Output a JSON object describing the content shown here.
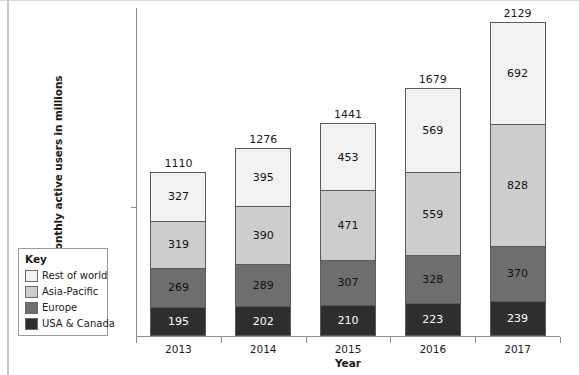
{
  "chart_data": {
    "type": "bar",
    "subtype": "stacked-bar",
    "title": "",
    "xlabel": "Year",
    "ylabel": "Monthly active users in millions",
    "categories": [
      "2013",
      "2014",
      "2015",
      "2016",
      "2017"
    ],
    "series": [
      {
        "name": "USA & Canada",
        "color": "#2e2e2e",
        "label_color": "#ffffff",
        "values": [
          195,
          202,
          210,
          223,
          239
        ]
      },
      {
        "name": "Europe",
        "color": "#6e6e6e",
        "label_color": "#111111",
        "values": [
          269,
          289,
          307,
          328,
          370
        ]
      },
      {
        "name": "Asia-Pacific",
        "color": "#cdcdcd",
        "label_color": "#111111",
        "values": [
          319,
          390,
          471,
          559,
          828
        ]
      },
      {
        "name": "Rest of world",
        "color": "#f2f2f2",
        "label_color": "#111111",
        "values": [
          327,
          395,
          453,
          569,
          692
        ]
      }
    ],
    "stack_order_bottom_to_top": [
      "USA & Canada",
      "Europe",
      "Asia-Pacific",
      "Rest of world"
    ],
    "totals": [
      1110,
      1276,
      1441,
      1679,
      2129
    ],
    "ylim": [
      0,
      2129
    ],
    "grid": false,
    "legend_position": "left-bottom-outside"
  },
  "legend": {
    "title": "Key",
    "entries": [
      {
        "label": "Rest of world",
        "color": "#f2f2f2"
      },
      {
        "label": "Asia-Pacific",
        "color": "#cdcdcd"
      },
      {
        "label": "Europe",
        "color": "#6e6e6e"
      },
      {
        "label": "USA & Canada",
        "color": "#2e2e2e"
      }
    ]
  },
  "axes": {
    "x_title": "Year",
    "y_title": "Monthly active users in millions",
    "x_tick_labels": [
      "2013",
      "2014",
      "2015",
      "2016",
      "2017"
    ]
  }
}
